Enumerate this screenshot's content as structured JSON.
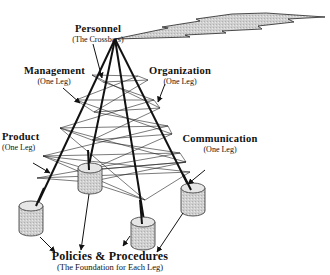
{
  "diagram": {
    "colors": {
      "line": "#111111",
      "cylinder_fill": "#c8c8c8",
      "cylinder_top": "#e6e6e6",
      "bolt_fill": "#d4d4d4",
      "background": "#ffffff"
    },
    "labels": {
      "personnel": {
        "title": "Personnel",
        "subtitle": "(The Crossbars)"
      },
      "management": {
        "title": "Management",
        "subtitle": "(One Leg)"
      },
      "organization": {
        "title": "Organization",
        "subtitle": "(One Leg)"
      },
      "product": {
        "title": "Product",
        "subtitle": "(One Leg)"
      },
      "communication": {
        "title": "Communication",
        "subtitle": "(One Leg)"
      },
      "policies": {
        "title": "Policies & Procedures",
        "subtitle": "(The Foundation for Each Leg)"
      }
    },
    "elements": {
      "apex": "tower-apex",
      "legs": [
        "product-leg",
        "management-leg",
        "organization-leg",
        "communication-leg"
      ],
      "crossbars": "personnel-crossbars",
      "foundations": [
        "cylinder-left",
        "cylinder-back",
        "cylinder-front",
        "cylinder-right"
      ],
      "signal": "lightning-bolt"
    }
  }
}
